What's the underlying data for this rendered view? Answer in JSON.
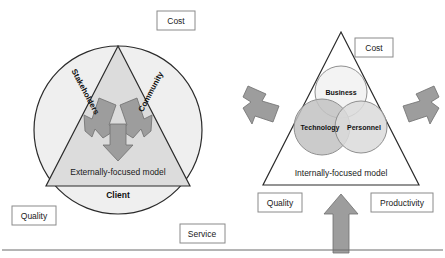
{
  "figure": {
    "colors": {
      "triangle_fill": "#dcdcdc",
      "circle_fill": "#efefef",
      "arrow_fill": "#9d9d9d",
      "outline": "#2b2b2b",
      "box_border": "#8a8a8a",
      "venn_business": "#f2f2f2",
      "venn_technology": "#c2c2c2",
      "venn_personnel": "#dadada",
      "background": "#ffffff"
    }
  },
  "left_diagram": {
    "name": "externally-focused-model",
    "center_label": "Externally-focused model",
    "edge_labels": {
      "left": "Stakeholders",
      "right": "Community",
      "base": "Client"
    },
    "corner_boxes": [
      {
        "id": "cost",
        "label": "Cost"
      },
      {
        "id": "quality",
        "label": "Quality"
      },
      {
        "id": "service",
        "label": "Service"
      }
    ],
    "arrows": [
      {
        "id": "arrow-from-stakeholders",
        "direction": "up-right"
      },
      {
        "id": "arrow-from-community",
        "direction": "up-left"
      },
      {
        "id": "arrow-to-client",
        "direction": "down"
      }
    ]
  },
  "right_diagram": {
    "name": "internally-focused-model",
    "center_label": "Internally-focused model",
    "venn_circles": [
      {
        "id": "business",
        "label": "Business",
        "position": "top"
      },
      {
        "id": "technology",
        "label": "Technology",
        "position": "bottom-left"
      },
      {
        "id": "personnel",
        "label": "Personnel",
        "position": "bottom-right"
      }
    ],
    "corner_boxes": [
      {
        "id": "cost",
        "label": "Cost"
      },
      {
        "id": "quality",
        "label": "Quality"
      },
      {
        "id": "productivity",
        "label": "Productivity"
      }
    ],
    "arrows": [
      {
        "id": "arrow-left-inward",
        "direction": "right"
      },
      {
        "id": "arrow-right-inward",
        "direction": "left"
      },
      {
        "id": "arrow-bottom-inward",
        "direction": "up"
      }
    ]
  }
}
